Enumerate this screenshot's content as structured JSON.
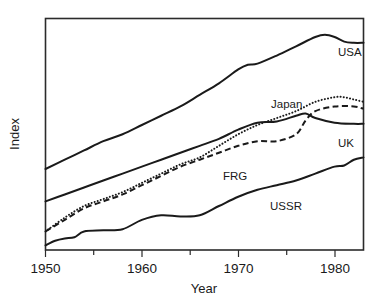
{
  "chart_data": {
    "type": "line",
    "title": "",
    "xlabel": "Year",
    "ylabel": "Index",
    "xlim": [
      1950,
      1983
    ],
    "ylim": [
      0,
      100
    ],
    "grid": false,
    "legend_position": "inline-right-end-labels",
    "x_tick_labels": [
      "1950",
      "1960",
      "1970",
      "1980"
    ],
    "x_major_ticks": [
      1950,
      1960,
      1970,
      1980
    ],
    "x_minor_ticks": [
      1955,
      1965,
      1975
    ],
    "y_tick_labels": [],
    "series": [
      {
        "name": "USA",
        "label": "USA",
        "style": "solid",
        "x": [
          1950,
          1952,
          1954,
          1956,
          1958,
          1960,
          1962,
          1964,
          1966,
          1968,
          1970,
          1971,
          1972,
          1974,
          1976,
          1978,
          1979,
          1980,
          1981,
          1982,
          1983
        ],
        "values": [
          35,
          39,
          43,
          47,
          50,
          54,
          58,
          62,
          67,
          72,
          78,
          80,
          80.5,
          84,
          88,
          92,
          93,
          92,
          90,
          89.5,
          89.5
        ]
      },
      {
        "name": "Japan",
        "label": "Japan",
        "style": "dotted",
        "x": [
          1950,
          1952,
          1954,
          1956,
          1958,
          1960,
          1962,
          1964,
          1966,
          1968,
          1970,
          1972,
          1974,
          1976,
          1978,
          1980,
          1981,
          1982,
          1983
        ],
        "values": [
          8,
          14,
          19,
          22,
          25,
          29,
          33,
          37,
          40,
          45,
          50,
          54,
          57,
          60,
          64,
          66,
          66,
          65,
          64
        ]
      },
      {
        "name": "UK",
        "label": "UK",
        "style": "solid",
        "x": [
          1950,
          1952,
          1954,
          1956,
          1958,
          1960,
          1962,
          1964,
          1966,
          1968,
          1970,
          1972,
          1974,
          1976,
          1977,
          1978,
          1980,
          1982,
          1983
        ],
        "values": [
          21,
          24,
          27,
          30,
          33,
          36,
          39,
          42,
          45,
          48,
          52,
          55,
          55.5,
          58,
          59,
          57,
          55,
          54.5,
          54.5
        ]
      },
      {
        "name": "FRG",
        "label": "FRG",
        "style": "dashed",
        "x": [
          1950,
          1952,
          1954,
          1956,
          1958,
          1960,
          1962,
          1964,
          1966,
          1968,
          1970,
          1972,
          1974,
          1976,
          1977,
          1978,
          1980,
          1982,
          1983
        ],
        "values": [
          8,
          13,
          18,
          21,
          24,
          28,
          32,
          36,
          39,
          42,
          45,
          47,
          47,
          50,
          56,
          60,
          62,
          62,
          61
        ]
      },
      {
        "name": "USSR",
        "label": "USSR",
        "style": "solid",
        "x": [
          1950,
          1951,
          1952,
          1953,
          1954,
          1956,
          1958,
          1960,
          1962,
          1964,
          1966,
          1968,
          1970,
          1972,
          1974,
          1976,
          1978,
          1980,
          1981,
          1982,
          1983
        ],
        "values": [
          2,
          4,
          5,
          5.5,
          8,
          8.5,
          9,
          13,
          15,
          14.5,
          15,
          19,
          23,
          26,
          28,
          30,
          33,
          36,
          36.5,
          39,
          40
        ]
      }
    ],
    "colors": {
      "ink": "#1a1a1a",
      "background": "#ffffff"
    }
  },
  "axis": {
    "x_title": "Year",
    "y_title": "Index"
  },
  "ticks": {
    "t0": "1950",
    "t1": "1960",
    "t2": "1970",
    "t3": "1980"
  },
  "labels": {
    "usa": "USA",
    "japan": "Japan",
    "uk": "UK",
    "frg": "FRG",
    "ussr": "USSR"
  }
}
